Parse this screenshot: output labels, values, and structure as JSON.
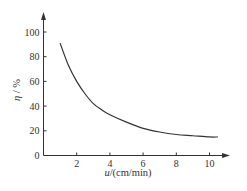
{
  "chart_data": {
    "type": "line",
    "title": "",
    "xlabel": "u/(cm/min)",
    "xlabel_var": "u",
    "xlabel_unit": "/(cm/min)",
    "ylabel": "η / %",
    "ylabel_var": "η",
    "ylabel_unit": " / %",
    "xlim": [
      0,
      11
    ],
    "ylim": [
      0,
      100
    ],
    "x_ticks": [
      2,
      4,
      6,
      8,
      10
    ],
    "y_ticks": [
      0,
      20,
      40,
      60,
      80,
      100
    ],
    "x_tick_labels": [
      "2",
      "4",
      "6",
      "8",
      "10"
    ],
    "y_tick_labels": [
      "0",
      "20",
      "40",
      "60",
      "80",
      "100"
    ],
    "grid": false,
    "legend": null,
    "series": [
      {
        "name": "η",
        "x": [
          1.0,
          1.5,
          2.0,
          2.5,
          3.0,
          3.5,
          4.0,
          5.0,
          6.0,
          7.0,
          8.0,
          9.0,
          10.0,
          10.5
        ],
        "values": [
          91,
          73,
          60,
          50,
          42,
          37,
          33,
          27,
          22,
          19,
          17,
          16,
          15,
          15
        ]
      }
    ]
  },
  "axes": {
    "origin_label": "0",
    "color": "#333333",
    "curve_color": "#333333"
  }
}
